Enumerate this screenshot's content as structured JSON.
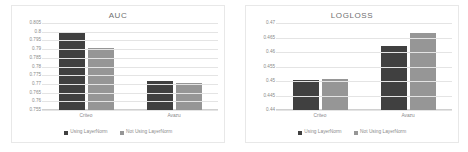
{
  "colors": {
    "series_1": "#404040",
    "series_2": "#969696",
    "gridline": "#e4e4e4",
    "tick_text": "#8a8a8a",
    "title_text": "#6f6f6f",
    "frame": "#e8e8e8",
    "background": "#ffffff"
  },
  "charts": [
    {
      "title": "AUC",
      "categories": [
        "Criteo",
        "Avazu"
      ],
      "y_ticks": [
        "0.805",
        "0.8",
        "0.795",
        "0.79",
        "0.785",
        "0.78",
        "0.775",
        "0.77",
        "0.765",
        "0.76",
        "0.755"
      ],
      "legend": [
        "Using LayerNorm",
        "Not Using LayerNorm"
      ]
    },
    {
      "title": "LOGLOSS",
      "categories": [
        "Criteo",
        "Avazu"
      ],
      "y_ticks": [
        "0.47",
        "0.465",
        "0.46",
        "0.455",
        "0.45",
        "0.445",
        "0.44"
      ],
      "legend": [
        "Using LayerNorm",
        "Not Using LayerNorm"
      ]
    }
  ],
  "chart_data": [
    {
      "type": "bar",
      "title": "AUC",
      "xlabel": "",
      "ylabel": "",
      "categories": [
        "Criteo",
        "Avazu"
      ],
      "series": [
        {
          "name": "Using LayerNorm",
          "values": [
            0.799,
            0.7715
          ],
          "color": "#404040"
        },
        {
          "name": "Not Using LayerNorm",
          "values": [
            0.7905,
            0.7705
          ],
          "color": "#969696"
        }
      ],
      "ylim": [
        0.755,
        0.805
      ],
      "ytick_step": 0.005,
      "grid": true,
      "legend_position": "bottom"
    },
    {
      "type": "bar",
      "title": "LOGLOSS",
      "xlabel": "",
      "ylabel": "",
      "categories": [
        "Criteo",
        "Avazu"
      ],
      "series": [
        {
          "name": "Using LayerNorm",
          "values": [
            0.4505,
            0.462
          ],
          "color": "#404040"
        },
        {
          "name": "Not Using LayerNorm",
          "values": [
            0.4508,
            0.4665
          ],
          "color": "#969696"
        }
      ],
      "ylim": [
        0.44,
        0.47
      ],
      "ytick_step": 0.005,
      "grid": true,
      "legend_position": "bottom"
    }
  ]
}
